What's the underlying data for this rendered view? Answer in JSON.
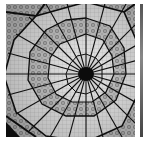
{
  "image": {
    "subject": "glass-dome-ceiling",
    "description": "Grayscale photograph looking up into a stained glass dome skylight with radial iron ribs converging at a dark central oculus, surrounded by concentric decagonal rings of ornamental glass panels",
    "colors": {
      "glass_light": "#e6e6e6",
      "glass_mid": "#b0b0b0",
      "ornament": "#7a7a7a",
      "ribs": "#111111",
      "background": "#ffffff"
    },
    "center": {
      "x": 86,
      "y": 70
    },
    "spokes": 24
  },
  "neighbor": {
    "subject": "adjacent-thumbnail-edge"
  },
  "caption": {
    "text": ""
  }
}
